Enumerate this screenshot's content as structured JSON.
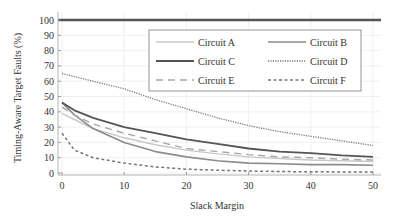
{
  "chart_data": {
    "type": "line",
    "title": "",
    "xlabel": "Slack Margin",
    "ylabel": "Timing-Aware Target Faults (%)",
    "xlim": [
      0,
      50
    ],
    "ylim": [
      0,
      100
    ],
    "xticks": [
      0,
      10,
      20,
      30,
      40,
      50
    ],
    "yticks": [
      0,
      10,
      20,
      30,
      40,
      50,
      60,
      70,
      80,
      90,
      100
    ],
    "grid": true,
    "legend_position": "upper right inside, 3 rows x 2 columns",
    "x": [
      0,
      2,
      5,
      10,
      15,
      20,
      25,
      30,
      35,
      40,
      45,
      50
    ],
    "series": [
      {
        "name": "Circuit A",
        "style": "solid-light",
        "color": "#c8c8c8",
        "values": [
          39,
          35,
          29,
          23,
          18.5,
          15,
          12.5,
          10.5,
          9.5,
          8.5,
          8,
          7.5
        ]
      },
      {
        "name": "Circuit B",
        "style": "solid-medium",
        "color": "#8c8c8c",
        "values": [
          46,
          38,
          29,
          20,
          14,
          10.5,
          8,
          6.5,
          6,
          5.5,
          5.5,
          5
        ]
      },
      {
        "name": "Circuit C",
        "style": "solid-dark",
        "color": "#555555",
        "values": [
          46,
          41,
          36,
          30,
          26,
          22,
          19,
          16,
          14,
          13,
          11.5,
          10.5
        ]
      },
      {
        "name": "Circuit D",
        "style": "dotted",
        "color": "#777777",
        "values": [
          65,
          63,
          60,
          55,
          48,
          42,
          36,
          31,
          27,
          24,
          21,
          18
        ]
      },
      {
        "name": "Circuit E",
        "style": "long-dash",
        "color": "#a8a8a8",
        "values": [
          43,
          38,
          32,
          26,
          21,
          16,
          14,
          12,
          10.5,
          10,
          9,
          8.5
        ]
      },
      {
        "name": "Circuit F",
        "style": "short-dash",
        "color": "#777777",
        "values": [
          26,
          15,
          10,
          6.5,
          4,
          2.5,
          1.8,
          1.3,
          1.0,
          0.8,
          0.7,
          0.6
        ]
      },
      {
        "name": "Reference (100%)",
        "style": "solid-thick",
        "color": "#555555",
        "values": [
          100,
          100,
          100,
          100,
          100,
          100,
          100,
          100,
          100,
          100,
          100,
          100
        ]
      }
    ]
  },
  "legend": {
    "items": [
      {
        "label": "Circuit A"
      },
      {
        "label": "Circuit B"
      },
      {
        "label": "Circuit C"
      },
      {
        "label": "Circuit D"
      },
      {
        "label": "Circuit E"
      },
      {
        "label": "Circuit F"
      }
    ]
  },
  "axes": {
    "xlabel": "Slack Margin",
    "ylabel": "Timing-Aware Target Faults (%)",
    "xtick_labels": [
      "0",
      "10",
      "20",
      "30",
      "40",
      "50"
    ],
    "ytick_labels": [
      "0",
      "10",
      "20",
      "30",
      "40",
      "50",
      "60",
      "70",
      "80",
      "90",
      "100"
    ]
  }
}
